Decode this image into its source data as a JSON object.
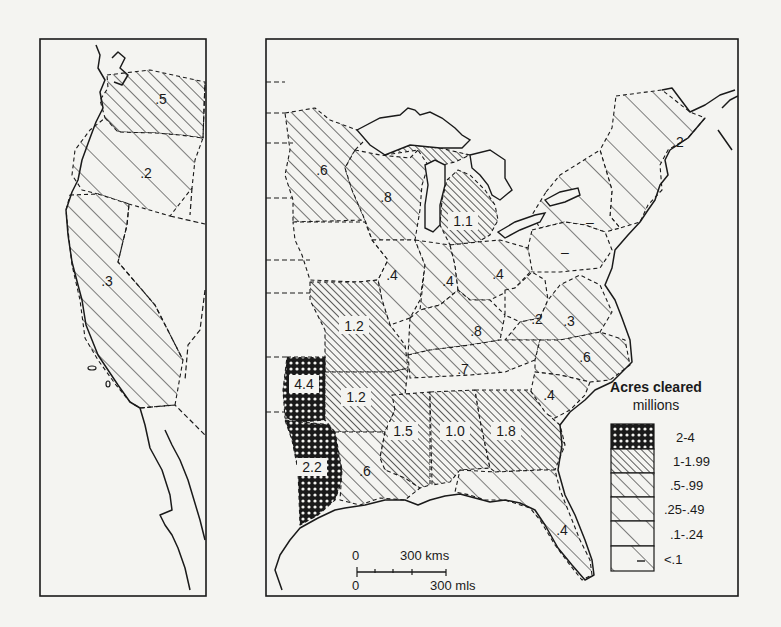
{
  "map": {
    "title": "Acres cleared",
    "units": "millions",
    "legend": [
      {
        "class": "2-4",
        "pattern": "crosshatch"
      },
      {
        "class": "1-1.99",
        "pattern": "dense-hatch"
      },
      {
        "class": ".5-.99",
        "pattern": "medium-hatch"
      },
      {
        "class": ".25-.49",
        "pattern": "sparse-hatch"
      },
      {
        "class": ".1-.24",
        "pattern": "very-sparse-hatch"
      },
      {
        "class": "<.1",
        "pattern": "single-hatch-dash"
      }
    ],
    "scale_bar": {
      "km_zero": "0",
      "km_label": "300 kms",
      "mi_zero": "0",
      "mi_label": "300 mls"
    },
    "west_panel": {
      "regions": [
        {
          "name": "Washington",
          "value": ".5"
        },
        {
          "name": "Oregon",
          "value": ".2"
        },
        {
          "name": "California",
          "value": ".3"
        }
      ]
    },
    "east_panel": {
      "regions": [
        {
          "name": "Minnesota",
          "value": ".6"
        },
        {
          "name": "Wisconsin",
          "value": ".8"
        },
        {
          "name": "Michigan",
          "value": "1.1"
        },
        {
          "name": "New England",
          "value": ".2"
        },
        {
          "name": "New York",
          "value": "–"
        },
        {
          "name": "Iowa",
          "value": ".3"
        },
        {
          "name": "Illinois",
          "value": ".4"
        },
        {
          "name": "Indiana",
          "value": ".4"
        },
        {
          "name": "Ohio",
          "value": ".4"
        },
        {
          "name": "Pennsylvania",
          "value": "–"
        },
        {
          "name": "Missouri",
          "value": "1.2"
        },
        {
          "name": "Kentucky",
          "value": ".8"
        },
        {
          "name": "West Virginia",
          "value": ".2"
        },
        {
          "name": "Virginia",
          "value": ".3"
        },
        {
          "name": "Tennessee",
          "value": ".7"
        },
        {
          "name": "North Carolina",
          "value": ".6"
        },
        {
          "name": "South Carolina",
          "value": ".4"
        },
        {
          "name": "East Texas",
          "value": "4.4"
        },
        {
          "name": "Southeast Texas",
          "value": "2.2"
        },
        {
          "name": "Arkansas",
          "value": "1.2"
        },
        {
          "name": "Louisiana",
          "value": ".6"
        },
        {
          "name": "Mississippi",
          "value": "1.5"
        },
        {
          "name": "Alabama",
          "value": "1.0"
        },
        {
          "name": "Georgia",
          "value": "1.8"
        },
        {
          "name": "Florida",
          "value": ".4"
        }
      ]
    },
    "colors": {
      "ink": "#1a1a1a",
      "paper": "#f4f4f1"
    }
  }
}
